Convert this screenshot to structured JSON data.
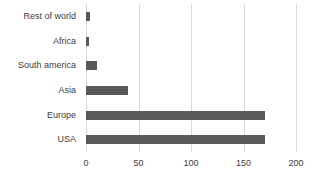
{
  "chart_data": {
    "type": "bar",
    "orientation": "horizontal",
    "title": "",
    "xlabel": "",
    "ylabel": "",
    "categories": [
      "Rest of world",
      "Africa",
      "South america",
      "Asia",
      "Europe",
      "USA"
    ],
    "values": [
      4,
      3,
      10,
      40,
      170,
      170
    ],
    "xlim": [
      0,
      200
    ],
    "xticks": [
      0,
      50,
      100,
      150,
      200
    ],
    "grid": "vertical-gridlines-on",
    "legend": "none",
    "bar_color": "#595959",
    "gridline_color": "#d9d9d9",
    "text_color": "#404040",
    "background_color": "#ffffff"
  }
}
